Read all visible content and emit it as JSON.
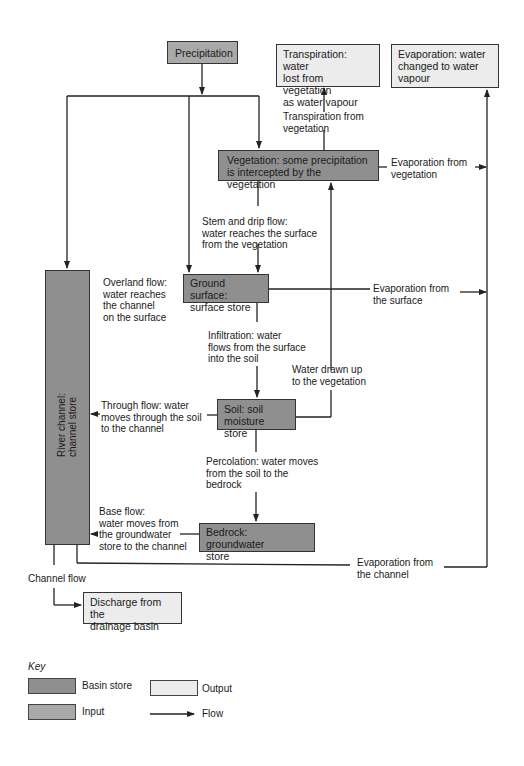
{
  "colors": {
    "basin_store": "#8f8f8f",
    "input": "#a9a9a9",
    "output": "#ececec",
    "line": "#222222"
  },
  "nodes": {
    "precipitation": "Precipitation",
    "transpiration_output": "Transpiration: water\nlost from vegetation\nas water vapour",
    "evaporation_output": "Evaporation: water\nchanged to water\nvapour",
    "vegetation": "Vegetation: some precipitation\nis intercepted by the vegetation",
    "ground_surface": "Ground surface:\nsurface store",
    "soil": "Soil: soil\nmoisture store",
    "bedrock": "Bedrock: groundwater\nstore",
    "river_channel": "River channel:\nchannel store",
    "discharge": "Discharge from the\ndrainage basin"
  },
  "flows": {
    "transpiration_from_vegetation": "Transpiration from\nvegetation",
    "evaporation_from_vegetation": "Evaporation from\nvegetation",
    "stem_drip_flow": "Stem and drip flow:\nwater reaches the surface\nfrom the vegetation",
    "overland_flow": "Overland flow:\nwater reaches\nthe channel\non the surface",
    "evaporation_from_surface": "Evaporation from\nthe surface",
    "infiltration": "Infiltration: water\nflows from the surface\ninto the soil",
    "water_drawn_up": "Water drawn up\nto the vegetation",
    "through_flow": "Through flow: water\nmoves through the soil\nto the channel",
    "percolation": "Percolation: water moves\nfrom the soil to the\nbedrock",
    "base_flow": "Base flow:\nwater moves from\nthe groundwater\nstore to the channel",
    "evaporation_from_channel": "Evaporation from\nthe channel",
    "channel_flow": "Channel flow"
  },
  "key": {
    "title": "Key",
    "basin_store": "Basin store",
    "input": "Input",
    "output": "Output",
    "flow": "Flow"
  }
}
